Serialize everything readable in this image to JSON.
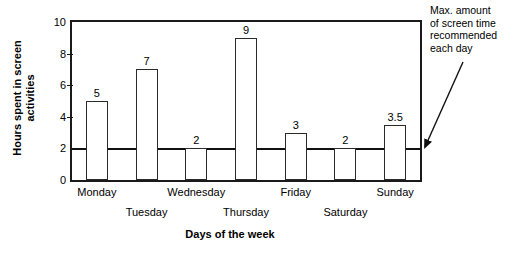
{
  "chart_data": {
    "type": "bar",
    "title": "",
    "xlabel": "Days of the week",
    "ylabel_line1": "Hours spent  in screen",
    "ylabel_line2": "activities",
    "categories": [
      "Monday",
      "Tuesday",
      "Wednesday",
      "Thursday",
      "Friday",
      "Saturday",
      "Sunday"
    ],
    "values": [
      5,
      7,
      2,
      9,
      3,
      2,
      3.5
    ],
    "value_labels": [
      "5",
      "7",
      "2",
      "9",
      "3",
      "2",
      "3.5"
    ],
    "ylim": [
      0,
      10
    ],
    "yticks": [
      0,
      2,
      4,
      6,
      8,
      10
    ],
    "ytick_labels": [
      "0",
      "2",
      "4",
      "6",
      "8",
      "10"
    ],
    "grid": false,
    "legend": "none",
    "bar_fill_color": "#ffffff",
    "bar_edge_color": "#2a2a2a",
    "threshold": {
      "value": 2,
      "color": "#111111",
      "label_line1": "Max. amount",
      "label_line2": "of screen time",
      "label_line3": "recommended",
      "label_line4": "each day"
    }
  },
  "annotation": {
    "line1": "Max. amount",
    "line2": "of screen time",
    "line3": "recommended",
    "line4": "each day"
  },
  "axes": {
    "x_title": "Days of the week",
    "y_title_line1": "Hours spent  in screen",
    "y_title_line2": "activities"
  }
}
